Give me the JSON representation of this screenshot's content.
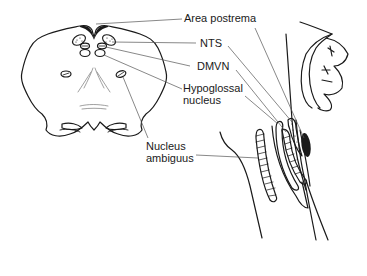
{
  "figure": {
    "labels": {
      "area_postrema": "Area postrema",
      "nts": "NTS",
      "dmvn": "DMVN",
      "hypoglossal_line1": "Hypoglossal",
      "hypoglossal_line2": "nucleus",
      "nucleus_ambiguus_line1": "Nucleus",
      "nucleus_ambiguus_line2": "ambiguus"
    },
    "colors": {
      "ink": "#1a1a1a",
      "leader_line": "#555555",
      "background": "#ffffff"
    }
  }
}
